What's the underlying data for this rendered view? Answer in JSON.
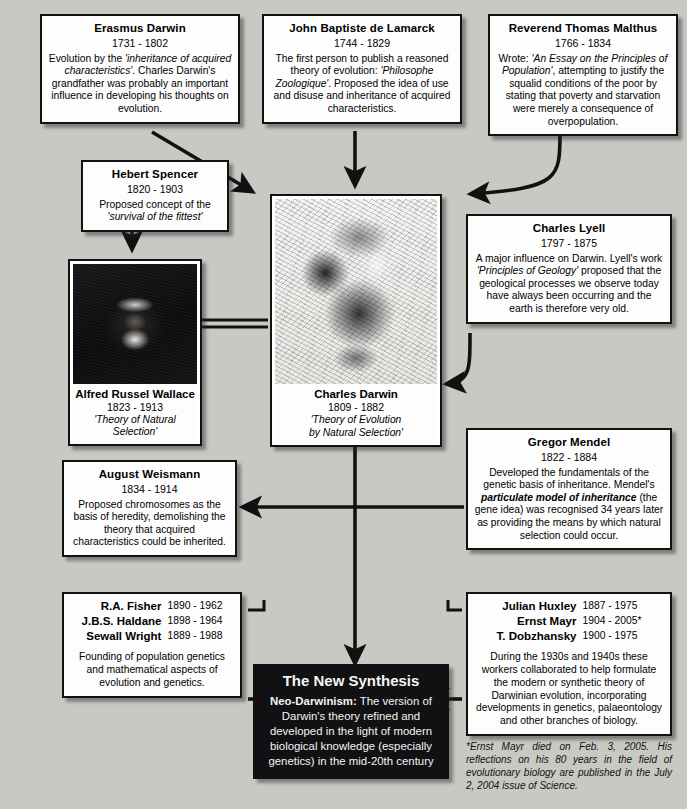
{
  "page": {
    "background_color": "#c9c9c4",
    "box_fill": "#fdfdfd",
    "ink": "#111111",
    "synthesis_fill": "#111113"
  },
  "boxes": {
    "erasmus": {
      "name": "Erasmus Darwin",
      "years": "1731 - 1802",
      "body_parts": [
        {
          "t": "Evolution by the ",
          "style": "normal"
        },
        {
          "t": "'inheritance of acquired characteristics'",
          "style": "italic"
        },
        {
          "t": ". Charles Darwin's grandfather was probably an important influence in developing his thoughts on evolution.",
          "style": "normal"
        }
      ]
    },
    "lamarck": {
      "name": "John Baptiste de Lamarck",
      "years": "1744 - 1829",
      "body_parts": [
        {
          "t": "The first person to publish a reasoned theory of evolution: ",
          "style": "normal"
        },
        {
          "t": "'Philosophe Zoologique'",
          "style": "italic"
        },
        {
          "t": ". Proposed the idea of use and disuse and inheritance of acquired characteristics.",
          "style": "normal"
        }
      ]
    },
    "malthus": {
      "name": "Reverend Thomas Malthus",
      "years": "1766 - 1834",
      "body_parts": [
        {
          "t": "Wrote: ",
          "style": "normal"
        },
        {
          "t": "'An Essay on the Principles of Population'",
          "style": "italic"
        },
        {
          "t": ", attempting to justify the squalid conditions of the poor by stating that poverty and starvation were merely a consequence of overpopulation.",
          "style": "normal"
        }
      ]
    },
    "spencer": {
      "name": "Hebert Spencer",
      "years": "1820 - 1903",
      "body_parts": [
        {
          "t": "Proposed concept of the ",
          "style": "normal"
        },
        {
          "t": "'survival of the fittest'",
          "style": "italic"
        }
      ]
    },
    "lyell": {
      "name": "Charles Lyell",
      "years": "1797 - 1875",
      "body_parts": [
        {
          "t": "A major influence on Darwin. Lyell's work ",
          "style": "normal"
        },
        {
          "t": "'Principles of Geology'",
          "style": "italic"
        },
        {
          "t": " proposed that the geological processes we observe today have always been occurring and the earth is therefore very old.",
          "style": "normal"
        }
      ]
    },
    "mendel": {
      "name": "Gregor Mendel",
      "years": "1822 - 1884",
      "body_parts": [
        {
          "t": "Developed the fundamentals of the genetic basis of inheritance. Mendel's ",
          "style": "normal"
        },
        {
          "t": "particulate model of inheritance",
          "style": "bolditalic"
        },
        {
          "t": " (the gene idea) was recognised 34 years later as providing the means by which natural selection could occur.",
          "style": "normal"
        }
      ]
    },
    "weismann": {
      "name": "August Weismann",
      "years": "1834 - 1914",
      "body_parts": [
        {
          "t": "Proposed chromosomes as the basis of heredity, demolishing the theory that acquired characteristics could be inherited.",
          "style": "normal"
        }
      ]
    }
  },
  "portraits": {
    "darwin": {
      "name": "Charles Darwin",
      "years": "1809 - 1882",
      "subtitle_line1": "'Theory of Evolution",
      "subtitle_line2": "by Natural Selection'",
      "image_name": "charles-darwin-engraving"
    },
    "wallace": {
      "name": "Alfred Russel Wallace",
      "years": "1823 - 1913",
      "subtitle_line1": "'Theory of Natural Selection'",
      "image_name": "alfred-russel-wallace-photograph"
    }
  },
  "population_genetics": {
    "people": [
      {
        "name": "R.A. Fisher",
        "dates": "1890 - 1962"
      },
      {
        "name": "J.B.S. Haldane",
        "dates": "1898 - 1964"
      },
      {
        "name": "Sewall Wright",
        "dates": "1889 - 1988"
      }
    ],
    "note": "Founding of population genetics and mathematical aspects of evolution and genetics."
  },
  "modern_synthesis_workers": {
    "people": [
      {
        "name": "Julian Huxley",
        "dates": "1887 - 1975"
      },
      {
        "name": "Ernst Mayr",
        "dates": "1904 - 2005*"
      },
      {
        "name": "T. Dobzhansky",
        "dates": "1900 - 1975"
      }
    ],
    "note": "During the 1930s and 1940s these workers collaborated to help formulate the modern or synthetic theory of Darwinian evolution, incorporating developments in genetics, palaeontology and other branches of biology."
  },
  "new_synthesis": {
    "title": "The New Synthesis",
    "lead": "Neo-Darwinism:",
    "body": " The version of Darwin's theory refined and developed in the light of modern biological knowledge (especially genetics) in the mid-20th century"
  },
  "footnote": {
    "text": "*Ernst Mayr died on Feb. 3, 2005. His reflections on his 80 years in the field of evolutionary biology are published in the July 2, 2004 issue of Science."
  }
}
